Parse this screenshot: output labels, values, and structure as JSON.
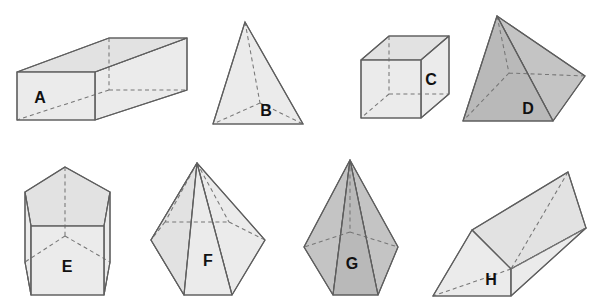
{
  "figure": {
    "background_color": "#ffffff",
    "width": 606,
    "height": 304,
    "rows": 2,
    "columns": 4,
    "edge_color": "#5e5e5e",
    "hidden_edge_color": "#767676",
    "fill_light": "#ebebeb",
    "fill_dark": "#c4c4c4",
    "label_color": "#111111"
  },
  "solids": [
    {
      "id": "A",
      "label": "A",
      "name": "rectangular-prism",
      "shading": "light",
      "row": 1,
      "column": 1,
      "label_x": 40,
      "label_y": 99
    },
    {
      "id": "B",
      "label": "B",
      "name": "tetrahedron",
      "shading": "light",
      "row": 1,
      "column": 2,
      "label_x": 266,
      "label_y": 112
    },
    {
      "id": "C",
      "label": "C",
      "name": "cube",
      "shading": "light",
      "row": 1,
      "column": 3,
      "label_x": 431,
      "label_y": 81
    },
    {
      "id": "D",
      "label": "D",
      "name": "square-pyramid",
      "shading": "dark",
      "row": 1,
      "column": 4,
      "label_x": 528,
      "label_y": 110
    },
    {
      "id": "E",
      "label": "E",
      "name": "pentagonal-prism",
      "shading": "light",
      "row": 2,
      "column": 1,
      "label_x": 67,
      "label_y": 268
    },
    {
      "id": "F",
      "label": "F",
      "name": "hexagonal-pyramid",
      "shading": "light",
      "row": 2,
      "column": 2,
      "label_x": 208,
      "label_y": 262
    },
    {
      "id": "G",
      "label": "G",
      "name": "pentagonal-pyramid",
      "shading": "dark",
      "row": 2,
      "column": 3,
      "label_x": 352,
      "label_y": 265
    },
    {
      "id": "H",
      "label": "H",
      "name": "triangular-prism",
      "shading": "light",
      "row": 2,
      "column": 4,
      "label_x": 491,
      "label_y": 281
    }
  ]
}
